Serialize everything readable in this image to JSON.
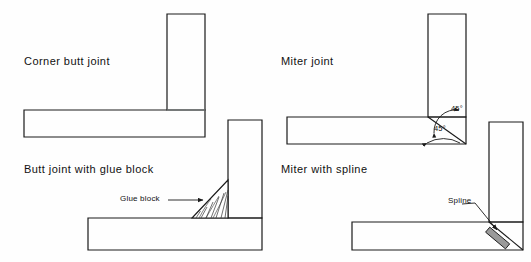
{
  "figure": {
    "background_color": "#fefefe",
    "line_color": "#1a1a1a",
    "hatch_color": "#333333",
    "spline_fill": "#9a9a9a"
  },
  "panels": [
    {
      "id": "corner-butt-joint",
      "caption": "Corner butt joint",
      "annotations": []
    },
    {
      "id": "butt-joint-with-glue-block",
      "caption": "Butt joint with glue block",
      "annotations": [
        {
          "id": "glue-block",
          "label": "Glue block"
        }
      ]
    },
    {
      "id": "miter-joint",
      "caption": "Miter joint",
      "annotations": [
        {
          "id": "angle-upper",
          "label": "45°"
        },
        {
          "id": "angle-lower",
          "label": "45°"
        }
      ]
    },
    {
      "id": "miter-with-spline",
      "caption": "Miter with spline",
      "annotations": [
        {
          "id": "spline",
          "label": "Spline"
        }
      ]
    }
  ],
  "captions": {
    "corner_butt_joint": "Corner butt joint",
    "butt_joint_with_glue_block": "Butt joint with glue block",
    "miter_joint": "Miter joint",
    "miter_with_spline": "Miter with spline"
  },
  "labels": {
    "glue_block": "Glue block",
    "spline": "Spline",
    "angle_upper": "45°",
    "angle_lower": "45°"
  }
}
